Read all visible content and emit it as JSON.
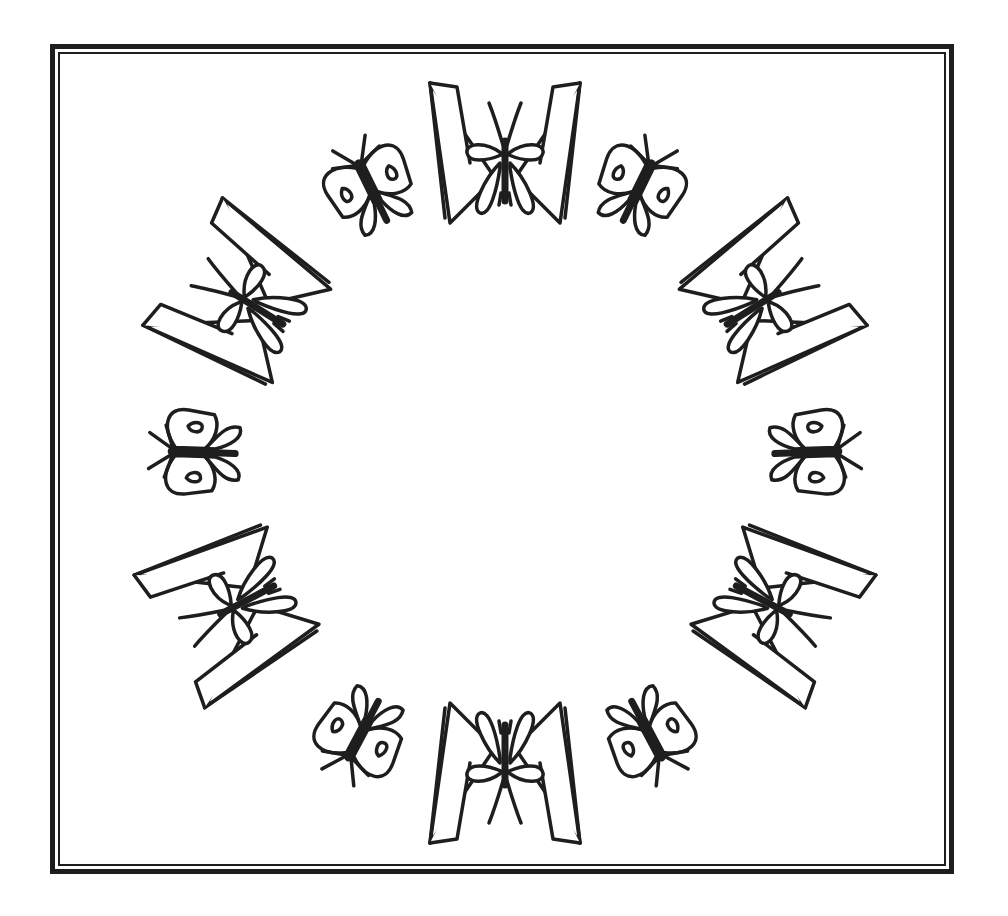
{
  "artwork": {
    "type": "coloring-page",
    "subject": "butterfly wreath",
    "frame": {
      "style": "double-line border",
      "color": "#1e1e1e"
    },
    "wreath": {
      "center": [
        505,
        463
      ],
      "motifs": [
        {
          "kind": "large-butterfly",
          "angle": 0
        },
        {
          "kind": "small-butterfly",
          "angle": 30
        },
        {
          "kind": "large-butterfly",
          "angle": 60
        },
        {
          "kind": "small-butterfly",
          "angle": 90
        },
        {
          "kind": "large-butterfly",
          "angle": 120
        },
        {
          "kind": "small-butterfly",
          "angle": 150
        },
        {
          "kind": "large-butterfly",
          "angle": 180
        },
        {
          "kind": "small-butterfly",
          "angle": 210
        },
        {
          "kind": "large-butterfly",
          "angle": 240
        },
        {
          "kind": "small-butterfly",
          "angle": 270
        },
        {
          "kind": "large-butterfly",
          "angle": 300
        },
        {
          "kind": "small-butterfly",
          "angle": 330
        }
      ],
      "stroke_color": "#1e1e1e",
      "fill_color": "#ffffff"
    }
  }
}
